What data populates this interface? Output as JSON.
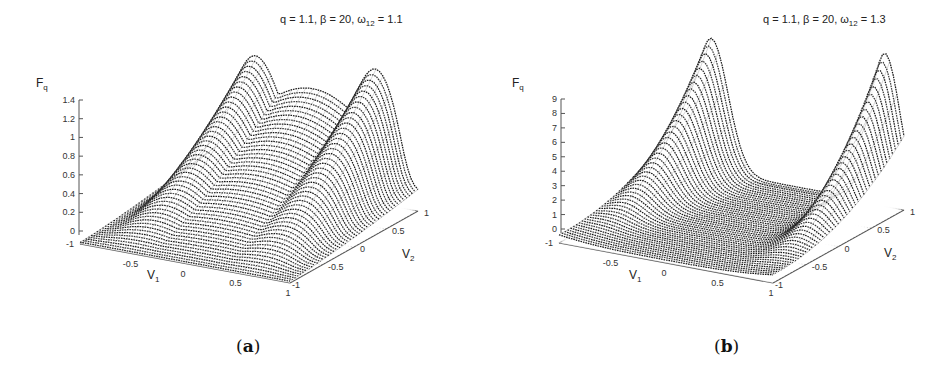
{
  "chart_data": [
    {
      "type": "surface3d",
      "panel": "a",
      "caption": "(a)",
      "title": "q = 1.1, β = 20, ω12 = 1.1",
      "title_parts": {
        "q": "1.1",
        "beta": "20",
        "omega12": "1.1"
      },
      "zlabel": "Fq",
      "xlabel": "V1",
      "ylabel": "V2",
      "zticks": [
        "0",
        "0.2",
        "0.4",
        "0.6",
        "0.8",
        "1",
        "1.2",
        "1.4"
      ],
      "zlim": [
        0,
        1.4
      ],
      "xticks": [
        "-1",
        "-0.5",
        "0",
        "0.5",
        "1"
      ],
      "yticks": [
        "-1",
        "-0.5",
        "0",
        "0.5",
        "1"
      ],
      "xlim": [
        -1,
        1
      ],
      "ylim": [
        -1,
        1
      ],
      "description": "Saddle-like surface with two broad maxima near V1≈-0.6 and V1≈+0.6 along the back edge, rising to ~1.35-1.45; minimum near the center ~0.05; edges near ~0.2",
      "approx_peaks": [
        {
          "V1": -0.6,
          "V2": 0.6,
          "Fq": 1.35
        },
        {
          "V1": 0.6,
          "V2": 0.6,
          "Fq": 1.45
        }
      ],
      "approx_min": {
        "V1": 0,
        "V2": 0,
        "Fq": 0.05
      },
      "grid": true
    },
    {
      "type": "surface3d",
      "panel": "b",
      "caption": "(b)",
      "title": "q = 1.1, β = 20, ω12 = 1.3",
      "title_parts": {
        "q": "1.1",
        "beta": "20",
        "omega12": "1.3"
      },
      "zlabel": "Fq",
      "xlabel": "V1",
      "ylabel": "V2",
      "zticks": [
        "0",
        "1",
        "2",
        "3",
        "4",
        "5",
        "6",
        "7",
        "8",
        "9"
      ],
      "zlim": [
        0,
        9
      ],
      "xticks": [
        "-1",
        "-0.5",
        "0",
        "0.5",
        "1"
      ],
      "yticks": [
        "-1",
        "-0.5",
        "0",
        "0.5",
        "1"
      ],
      "xlim": [
        -1,
        1
      ],
      "ylim": [
        -1,
        1
      ],
      "description": "Surface with two sharp peaks at the back corners (V1≈-0.8 and V1≈+0.8, V2≈0.8) reaching ~9 and ~10; broad flat valley near 0-1 across center",
      "approx_peaks": [
        {
          "V1": -0.8,
          "V2": 0.8,
          "Fq": 9.0
        },
        {
          "V1": 0.8,
          "V2": 0.8,
          "Fq": 10.0
        }
      ],
      "approx_min": {
        "V1": 0,
        "V2": 0,
        "Fq": 0.3
      },
      "grid": true
    }
  ],
  "panels": {
    "a": {
      "title_prefix": "q = 1.1, β = 20, ω",
      "title_sub": "12",
      "title_suffix": " = 1.1",
      "zlabel_main": "F",
      "zlabel_sub": "q",
      "xlabel_main": "V",
      "xlabel_sub": "1",
      "ylabel_main": "V",
      "ylabel_sub": "2",
      "caption_open": "(",
      "caption_letter": "a",
      "caption_close": ")"
    },
    "b": {
      "title_prefix": "q = 1.1, β = 20, ω",
      "title_sub": "12",
      "title_suffix": " = 1.3",
      "zlabel_main": "F",
      "zlabel_sub": "q",
      "xlabel_main": "V",
      "xlabel_sub": "1",
      "ylabel_main": "V",
      "ylabel_sub": "2",
      "caption_open": "(",
      "caption_letter": "b",
      "caption_close": ")"
    }
  },
  "colors": {
    "surface": "#1a1a1a",
    "axis": "#555555",
    "grid": "#9a9a9a",
    "text": "#222222"
  }
}
